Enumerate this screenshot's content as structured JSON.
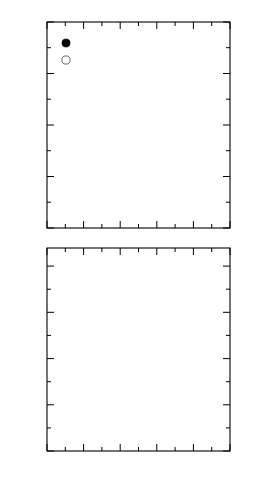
{
  "figure": {
    "xlabel": "Incident energy (keV)",
    "xlim": [
      0,
      5
    ],
    "xticks": [
      "0",
      "1",
      "2",
      "3",
      "4",
      "5"
    ],
    "annotation": "He+ → Mg",
    "annotation_parts": {
      "species": "He",
      "charge": "+",
      "arrow": "→",
      "target": "Mg"
    }
  },
  "chart_data": [
    {
      "type": "scatter",
      "panel": "top",
      "title": "",
      "xlabel": "",
      "ylabel": "A (10-3 e/eV)",
      "ylabel_parts": {
        "symbol": "A",
        "open": "(10",
        "exp": "-3",
        "unit": " e/eV)"
      },
      "xlim": [
        0,
        5
      ],
      "ylim": [
        0,
        4
      ],
      "xticks": [
        "0",
        "1",
        "2",
        "3",
        "4",
        "5"
      ],
      "yticks": [
        "0",
        "1",
        "2",
        "3",
        "4"
      ],
      "grid": false,
      "legend_position": "top-left",
      "series": [
        {
          "name": "A_BP",
          "label_base": "A",
          "label_sub": "BP",
          "marker": "filled-circle",
          "points": [
            [
              0.6,
              0.36
            ],
            [
              0.8,
              0.46
            ],
            [
              1.0,
              0.76
            ],
            [
              1.2,
              1.15
            ],
            [
              1.5,
              1.68
            ],
            [
              1.8,
              1.88
            ],
            [
              2.0,
              2.21
            ],
            [
              2.2,
              2.4
            ],
            [
              2.5,
              2.68
            ],
            [
              2.8,
              2.98
            ],
            [
              3.0,
              2.72
            ],
            [
              3.2,
              3.08
            ],
            [
              3.5,
              3.44
            ],
            [
              4.0,
              3.55
            ],
            [
              4.5,
              3.65
            ]
          ]
        },
        {
          "name": "A_SP",
          "label_base": "A",
          "label_sub": "SP",
          "marker": "open-circle",
          "points": [
            [
              0.6,
              2.47
            ],
            [
              0.8,
              2.43
            ],
            [
              0.8,
              1.77
            ],
            [
              1.2,
              2.07
            ],
            [
              1.2,
              1.77
            ],
            [
              1.5,
              2.06
            ],
            [
              1.8,
              1.95
            ],
            [
              2.0,
              1.47
            ],
            [
              2.2,
              1.43
            ],
            [
              2.5,
              1.36
            ],
            [
              2.5,
              1.13
            ],
            [
              2.8,
              1.35
            ],
            [
              3.0,
              1.29
            ],
            [
              3.2,
              1.22
            ],
            [
              3.5,
              1.0
            ],
            [
              4.5,
              1.22
            ]
          ]
        }
      ],
      "fits": [
        {
          "name": "A_BP-fit",
          "style": "curve",
          "path": [
            [
              0.55,
              0.0
            ],
            [
              0.8,
              0.5
            ],
            [
              1.1,
              1.0
            ],
            [
              1.4,
              1.48
            ],
            [
              1.7,
              1.87
            ],
            [
              2.0,
              2.22
            ],
            [
              2.3,
              2.52
            ],
            [
              2.6,
              2.79
            ],
            [
              2.9,
              3.02
            ],
            [
              3.2,
              3.22
            ],
            [
              3.5,
              3.4
            ],
            [
              3.8,
              3.56
            ],
            [
              4.1,
              3.69
            ],
            [
              4.4,
              3.79
            ],
            [
              4.7,
              3.87
            ]
          ]
        },
        {
          "name": "A_SP-fit",
          "style": "line",
          "path": [
            [
              0.52,
              2.22
            ],
            [
              4.7,
              0.7
            ]
          ]
        }
      ]
    },
    {
      "type": "scatter",
      "panel": "bottom",
      "title": "",
      "xlabel": "Incident energy (keV)",
      "ylabel": "R = ABP/gammatot (10-3/eV)",
      "ylabel_parts": {
        "r": "R = A",
        "sub1": "BP",
        "slash": "/γ",
        "sub2": "tot",
        "open": " (10",
        "exp": "-3",
        "unit": "/eV)"
      },
      "xlim": [
        0,
        5
      ],
      "ylim": [
        0,
        4.3
      ],
      "xticks": [
        "0",
        "1",
        "2",
        "3",
        "4",
        "5"
      ],
      "yticks": [
        "0",
        "1",
        "2",
        "3",
        "4"
      ],
      "grid": false,
      "series": [
        {
          "name": "R",
          "marker": "filled-circle",
          "points": [
            [
              0.6,
              0.93
            ],
            [
              0.8,
              1.03
            ],
            [
              1.0,
              1.62
            ],
            [
              1.2,
              2.46
            ],
            [
              1.5,
              2.88
            ],
            [
              1.8,
              2.82
            ],
            [
              2.0,
              3.1
            ],
            [
              2.2,
              3.15
            ],
            [
              2.5,
              3.39
            ],
            [
              2.8,
              3.58
            ],
            [
              3.0,
              3.22
            ],
            [
              3.2,
              3.56
            ],
            [
              3.5,
              3.83
            ],
            [
              4.0,
              3.82
            ],
            [
              4.5,
              3.83
            ]
          ]
        }
      ],
      "fits": []
    }
  ]
}
